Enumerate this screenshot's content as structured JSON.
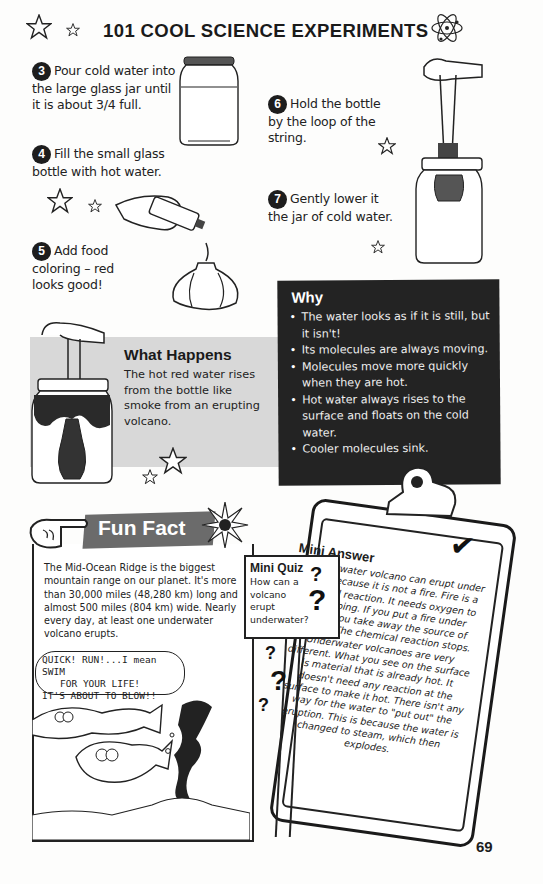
{
  "header": {
    "title": "101 COOL SCIENCE EXPERIMENTS",
    "icons": [
      "star-outline-icon",
      "star-small-icon",
      "atom-icon"
    ]
  },
  "steps": [
    {
      "number": "3",
      "text": "Pour cold water into the large glass jar until it is about 3/4 full."
    },
    {
      "number": "4",
      "text": "Fill the small glass bottle with hot water."
    },
    {
      "number": "5",
      "text": "Add food coloring – red looks good!"
    },
    {
      "number": "6",
      "text": "Hold the bottle by the loop of the string."
    },
    {
      "number": "7",
      "text": "Gently lower it the jar of cold water."
    }
  ],
  "why": {
    "title": "Why",
    "items": [
      "The water looks as if it is still, but it isn't!",
      "Its molecules are always moving.",
      "Molecules move more quickly when they are hot.",
      "Hot water always rises to the surface and floats on the cold water.",
      "Cooler molecules sink."
    ]
  },
  "what_happens": {
    "title": "What Happens",
    "text": "The hot red water rises from the bottle like smoke from an erupting volcano."
  },
  "fun_fact": {
    "title": "Fun Fact",
    "text": "The Mid-Ocean Ridge is the biggest mountain range on our planet. It's more than 30,000 miles (48,280 km) long and almost 500 miles (804 km) wide. Nearly every day, at least one underwater volcano erupts.",
    "cartoon_speech": [
      "QUICK! RUN!...I mean SWIM",
      "FOR YOUR LIFE!",
      "IT'S ABOUT TO BLOW!!"
    ]
  },
  "mini_quiz": {
    "title": "Mini Quiz",
    "question": "How can a volcano erupt underwater?"
  },
  "mini_answer": {
    "title": "Mini Answer",
    "text": "An underwater volcano can erupt under water because it is not a fire. Fire is a chemical reaction. It needs oxygen to keep going. If you put a fire under water, you take away the source of oxygen. The chemical reaction stops. Underwater volcanoes are very different. What you see on the surface is material that is already hot. It doesn't need any reaction at the surface to make it hot. There isn't any way for the water to \"put out\" the eruption. This is because the water is changed to steam, which then explodes."
  },
  "page_number": "69",
  "colors": {
    "why_bg": "#232323",
    "what_happens_bg": "#d8d8d8",
    "fun_fact_banner": "#6b6b6b"
  }
}
